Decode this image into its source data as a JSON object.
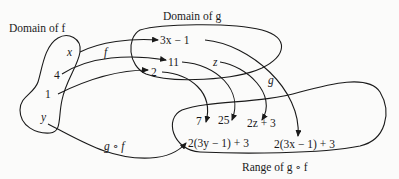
{
  "diagram": {
    "title_domain_f": "Domain of f",
    "title_domain_g": "Domain of g",
    "title_range": "Range of g ∘ f",
    "domain_f_elements": [
      "x",
      "4",
      "1",
      "y"
    ],
    "domain_g_elements": [
      "3x − 1",
      "11",
      "2",
      "z"
    ],
    "range_elements": [
      "7",
      "25",
      "2z + 3",
      "2(3y − 1) + 3",
      "2(3x − 1) + 3"
    ],
    "arrow_labels": {
      "f": "f",
      "g": "g",
      "composite": "g ∘ f"
    },
    "colors": {
      "ink": "#1a1a1a",
      "background": "#fbfbfa"
    }
  }
}
